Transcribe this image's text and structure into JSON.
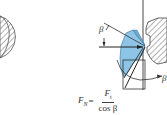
{
  "diagram": {
    "type": "engineering force diagram (gear/cutter contact)",
    "labels": {
      "beta_angle": "β",
      "right_partial_label": "β"
    },
    "formula": {
      "lhs_symbol": "F",
      "lhs_subscript": "N",
      "equals": "=",
      "numerator_symbol": "F",
      "numerator_subscript": "t",
      "denominator": "cos β"
    },
    "colors": {
      "tool_fill": "#8ec4e6",
      "tool_fill_dark": "#6aa9d6",
      "line": "#333333",
      "hatch": "#555555",
      "background": "#ffffff"
    }
  }
}
